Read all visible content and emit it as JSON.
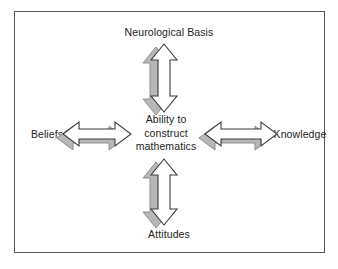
{
  "diagram": {
    "title_text": "Ability to construct mathematics",
    "center": {
      "line1": "Ability to",
      "line2": "construct",
      "line3": "mathematics"
    },
    "nodes": {
      "top": "Neurological Basis",
      "bottom": "Attitudes",
      "left": "Beliefs",
      "right": "Knowledge"
    },
    "arrows": [
      {
        "name": "arrow-up-double",
        "direction": "vertical",
        "connects": [
          "Ability to construct mathematics",
          "Neurological Basis"
        ]
      },
      {
        "name": "arrow-down-double",
        "direction": "vertical",
        "connects": [
          "Ability to construct mathematics",
          "Attitudes"
        ]
      },
      {
        "name": "arrow-left-double",
        "direction": "horizontal",
        "connects": [
          "Ability to construct mathematics",
          "Beliefs"
        ]
      },
      {
        "name": "arrow-right-double",
        "direction": "horizontal",
        "connects": [
          "Ability to construct mathematics",
          "Knowledge"
        ]
      }
    ],
    "colors": {
      "frame_border": "#595959",
      "background": "#ffffff",
      "arrow_fill": "#ffffff",
      "arrow_stroke": "#3a3a3a",
      "arrow_shadow": "#b8b8b8",
      "text": "#222222"
    }
  }
}
